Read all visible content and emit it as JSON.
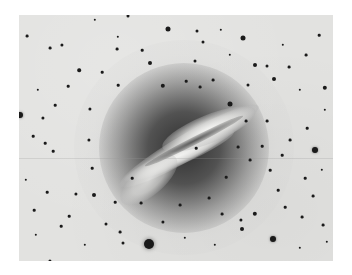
{
  "image": {
    "subject": "negative photograph of a galaxy with a prominent dust lane in a star field",
    "frame": {
      "left": 19,
      "top": 15,
      "width": 314,
      "height": 246
    },
    "colors": {
      "page_background": "#ffffff",
      "sky": "#e2e2e0",
      "stars": "#1a1a1a",
      "halo_core": "#3a3a3a"
    }
  },
  "stars": [
    {
      "x": 149,
      "y": 244,
      "r": 5
    },
    {
      "x": 20,
      "y": 115,
      "r": 3
    },
    {
      "x": 315,
      "y": 150,
      "r": 3
    },
    {
      "x": 273,
      "y": 239,
      "r": 3
    },
    {
      "x": 168,
      "y": 29,
      "r": 2.5
    },
    {
      "x": 243,
      "y": 38,
      "r": 2.5
    },
    {
      "x": 325,
      "y": 88,
      "r": 2.2
    },
    {
      "x": 163,
      "y": 86,
      "r": 2.2
    },
    {
      "x": 150,
      "y": 63,
      "r": 2
    },
    {
      "x": 255,
      "y": 65,
      "r": 2
    },
    {
      "x": 274,
      "y": 79,
      "r": 2
    },
    {
      "x": 230,
      "y": 104,
      "r": 2.5
    },
    {
      "x": 255,
      "y": 214,
      "r": 2.2
    },
    {
      "x": 242,
      "y": 229,
      "r": 2
    },
    {
      "x": 94,
      "y": 195,
      "r": 2
    },
    {
      "x": 79,
      "y": 70,
      "r": 1.8
    },
    {
      "x": 62,
      "y": 45,
      "r": 1.6
    },
    {
      "x": 50,
      "y": 48,
      "r": 1.4
    },
    {
      "x": 27,
      "y": 36,
      "r": 1.4
    },
    {
      "x": 117,
      "y": 49,
      "r": 1.4
    },
    {
      "x": 118,
      "y": 37,
      "r": 1.2
    },
    {
      "x": 197,
      "y": 31,
      "r": 1.5
    },
    {
      "x": 203,
      "y": 42,
      "r": 1.5
    },
    {
      "x": 195,
      "y": 61,
      "r": 1.5
    },
    {
      "x": 267,
      "y": 66,
      "r": 1.5
    },
    {
      "x": 248,
      "y": 85,
      "r": 1.5
    },
    {
      "x": 289,
      "y": 67,
      "r": 1.4
    },
    {
      "x": 319,
      "y": 35,
      "r": 1.3
    },
    {
      "x": 306,
      "y": 55,
      "r": 1.4
    },
    {
      "x": 43,
      "y": 118,
      "r": 1.6
    },
    {
      "x": 90,
      "y": 109,
      "r": 1.6
    },
    {
      "x": 89,
      "y": 140,
      "r": 1.6
    },
    {
      "x": 33,
      "y": 136,
      "r": 1.3
    },
    {
      "x": 45,
      "y": 143,
      "r": 1.3
    },
    {
      "x": 53,
      "y": 151,
      "r": 1.3
    },
    {
      "x": 34,
      "y": 210,
      "r": 1.3
    },
    {
      "x": 76,
      "y": 194,
      "r": 1.6
    },
    {
      "x": 106,
      "y": 224,
      "r": 1.5
    },
    {
      "x": 123,
      "y": 243,
      "r": 1.5
    },
    {
      "x": 50,
      "y": 261,
      "r": 1.6
    },
    {
      "x": 61,
      "y": 226,
      "r": 1.3
    },
    {
      "x": 120,
      "y": 232,
      "r": 1.4
    },
    {
      "x": 163,
      "y": 222,
      "r": 1.6
    },
    {
      "x": 209,
      "y": 198,
      "r": 1.4
    },
    {
      "x": 222,
      "y": 214,
      "r": 1.4
    },
    {
      "x": 241,
      "y": 220,
      "r": 1.6
    },
    {
      "x": 302,
      "y": 217,
      "r": 1.4
    },
    {
      "x": 323,
      "y": 225,
      "r": 1.4
    },
    {
      "x": 313,
      "y": 196,
      "r": 1.4
    },
    {
      "x": 285,
      "y": 207,
      "r": 1.3
    },
    {
      "x": 290,
      "y": 140,
      "r": 1.4
    },
    {
      "x": 307,
      "y": 128,
      "r": 1.3
    },
    {
      "x": 267,
      "y": 121,
      "r": 1.4
    },
    {
      "x": 246,
      "y": 121,
      "r": 1.4
    },
    {
      "x": 262,
      "y": 146,
      "r": 1.3
    },
    {
      "x": 282,
      "y": 155,
      "r": 1.3
    },
    {
      "x": 238,
      "y": 147,
      "r": 1.4
    },
    {
      "x": 250,
      "y": 160,
      "r": 1.4
    },
    {
      "x": 270,
      "y": 170,
      "r": 1.3
    },
    {
      "x": 305,
      "y": 178,
      "r": 1.3
    },
    {
      "x": 278,
      "y": 190,
      "r": 1.3
    },
    {
      "x": 226,
      "y": 177,
      "r": 1.3
    },
    {
      "x": 196,
      "y": 148,
      "r": 1.3
    },
    {
      "x": 180,
      "y": 205,
      "r": 1.4
    },
    {
      "x": 141,
      "y": 203,
      "r": 1.4
    },
    {
      "x": 132,
      "y": 178,
      "r": 1.3
    },
    {
      "x": 115,
      "y": 202,
      "r": 1.3
    },
    {
      "x": 69,
      "y": 216,
      "r": 1.3
    },
    {
      "x": 92,
      "y": 168,
      "r": 1.3
    },
    {
      "x": 26,
      "y": 180,
      "r": 1.2
    },
    {
      "x": 47,
      "y": 192,
      "r": 1.3
    },
    {
      "x": 200,
      "y": 87,
      "r": 1.4
    },
    {
      "x": 213,
      "y": 80,
      "r": 1.4
    },
    {
      "x": 186,
      "y": 81,
      "r": 1.3
    },
    {
      "x": 142,
      "y": 50,
      "r": 1.3
    },
    {
      "x": 102,
      "y": 72,
      "r": 1.3
    },
    {
      "x": 118,
      "y": 85,
      "r": 1.3
    },
    {
      "x": 55,
      "y": 105,
      "r": 1.3
    },
    {
      "x": 68,
      "y": 86,
      "r": 1.3
    },
    {
      "x": 38,
      "y": 90,
      "r": 1.2
    },
    {
      "x": 221,
      "y": 30,
      "r": 1.2
    },
    {
      "x": 230,
      "y": 55,
      "r": 1.2
    },
    {
      "x": 283,
      "y": 45,
      "r": 1.2
    },
    {
      "x": 300,
      "y": 90,
      "r": 1.2
    },
    {
      "x": 325,
      "y": 110,
      "r": 1.2
    },
    {
      "x": 322,
      "y": 170,
      "r": 1.2
    },
    {
      "x": 327,
      "y": 242,
      "r": 1.2
    },
    {
      "x": 300,
      "y": 248,
      "r": 1.2
    },
    {
      "x": 215,
      "y": 245,
      "r": 1.2
    },
    {
      "x": 185,
      "y": 238,
      "r": 1.2
    },
    {
      "x": 85,
      "y": 245,
      "r": 1.2
    },
    {
      "x": 36,
      "y": 235,
      "r": 1.2
    },
    {
      "x": 95,
      "y": 20,
      "r": 1.2
    },
    {
      "x": 128,
      "y": 16,
      "r": 1.5
    }
  ]
}
